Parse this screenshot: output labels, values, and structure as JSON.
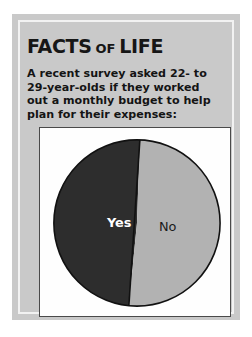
{
  "card": {
    "title_main_1": "FACTS",
    "title_connector": "OF",
    "title_main_2": "LIFE",
    "body_text": "A recent survey asked 22- to 29-year-olds if they worked out a monthly budget to help plan for their expenses:",
    "panel_color": "#c9c9c9",
    "inner_border_color": "#f2f2f2",
    "text_color": "#141414"
  },
  "chart_data": {
    "type": "pie",
    "title": "",
    "subtitle": "",
    "xlabel": "",
    "ylabel": "",
    "labels": [
      "Yes",
      "No"
    ],
    "values": [
      49,
      51
    ],
    "colors": [
      "#2d2d2d",
      "#b2b2b2"
    ],
    "legend": "none",
    "grid": false,
    "start_angle_deg": 2,
    "direction": "counterclockwise",
    "slices": [
      {
        "label": "Yes",
        "value": 49,
        "color": "#2d2d2d",
        "label_color": "#ffffff",
        "label_x": 80,
        "label_y": 100
      },
      {
        "label": "No",
        "value": 51,
        "color": "#b2b2b2",
        "label_color": "#1b1b1b",
        "label_x": 129,
        "label_y": 104
      }
    ],
    "geometry": {
      "center_x": 98,
      "center_y": 96,
      "radius": 84,
      "outline_color": "#111111",
      "outline_width": 1.6
    }
  }
}
